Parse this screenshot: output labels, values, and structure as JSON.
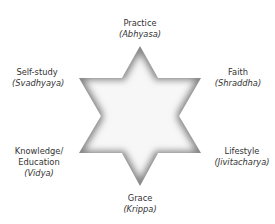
{
  "diagram": {
    "shape": "six-pointed star",
    "center_fill": "#f7f7f7",
    "edge_shade": "#8a8a8a",
    "labels": [
      {
        "id": "practice",
        "lines": [
          "Practice"
        ],
        "sanskrit": "(Abhyasa)"
      },
      {
        "id": "faith",
        "lines": [
          "Faith"
        ],
        "sanskrit": "(Shraddha)"
      },
      {
        "id": "lifestyle",
        "lines": [
          "Lifestyle"
        ],
        "sanskrit": "(Jivitacharya)"
      },
      {
        "id": "grace",
        "lines": [
          "Grace"
        ],
        "sanskrit": "(Krippa)"
      },
      {
        "id": "knowledge",
        "lines": [
          "Knowledge/",
          "Education"
        ],
        "sanskrit": "(Vidya)"
      },
      {
        "id": "self-study",
        "lines": [
          "Self-study"
        ],
        "sanskrit": "(Svadhyaya)"
      }
    ]
  }
}
